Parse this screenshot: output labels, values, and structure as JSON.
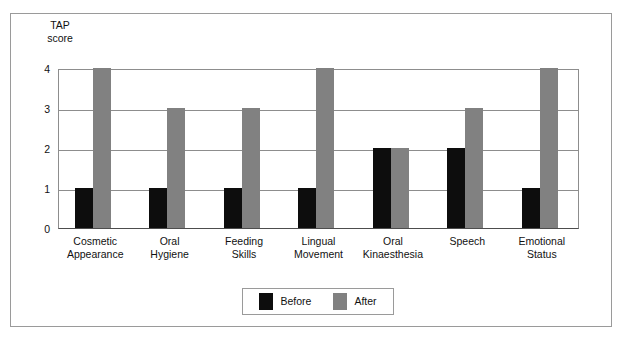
{
  "chart_data": {
    "type": "bar",
    "title": "",
    "subtitle": "",
    "ylabel": "TAP\nscore",
    "xlabel": "",
    "ylim": [
      0,
      4
    ],
    "yticks": [
      "0",
      "1",
      "2",
      "3",
      "4"
    ],
    "grid": true,
    "legend_position": "bottom-center",
    "categories": [
      "Cosmetic\nAppearance",
      "Oral\nHygiene",
      "Feeding\nSkills",
      "Lingual\nMovement",
      "Oral\nKinaesthesia",
      "Speech",
      "Emotional\nStatus"
    ],
    "series": [
      {
        "name": "Before",
        "color": "#0d0d0d",
        "values": [
          1,
          1,
          1,
          1,
          2,
          2,
          1
        ]
      },
      {
        "name": "After",
        "color": "#818181",
        "values": [
          4,
          3,
          3,
          4,
          2,
          3,
          4
        ]
      }
    ]
  },
  "legend": {
    "items": [
      {
        "label": "Before",
        "color": "#0d0d0d"
      },
      {
        "label": "After",
        "color": "#818181"
      }
    ]
  },
  "colors": {
    "frame_border": "#9a9a9a",
    "gridline": "#8d8d8d",
    "axis": "#4d4d4d",
    "background": "#ffffff",
    "before_bar": "#0d0d0d",
    "after_bar": "#818181"
  }
}
